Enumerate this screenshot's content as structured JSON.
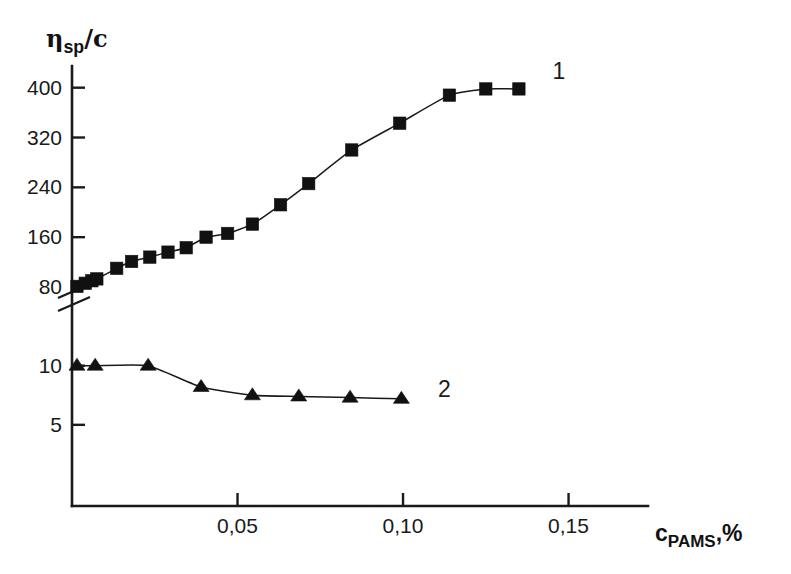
{
  "chart_data": {
    "type": "line",
    "title": "",
    "subtitle": "",
    "xlabel": "c_PAMS, %",
    "ylabel": "eta_sp/c",
    "xlim": [
      0,
      0.174
    ],
    "ylim_upper": [
      80,
      430
    ],
    "ylim_lower": [
      0,
      12
    ],
    "grid": false,
    "legend_position": "inline-right",
    "axis_break": true,
    "axis_break_note": "y-axis broken between 10 and 80",
    "xticks": [
      0.05,
      0.1,
      0.15
    ],
    "xtick_labels": [
      "0,05",
      "0,10",
      "0,15"
    ],
    "yticks_upper": [
      80,
      160,
      240,
      320,
      400
    ],
    "ytick_labels_upper": [
      "80",
      "160",
      "240",
      "320",
      "400"
    ],
    "yticks_lower": [
      5,
      10
    ],
    "ytick_labels_lower": [
      "5",
      "10"
    ],
    "series": [
      {
        "name": "1",
        "label": "1",
        "marker": "square",
        "axis": "upper",
        "x": [
          0.0015,
          0.004,
          0.006,
          0.0075,
          0.0135,
          0.018,
          0.0235,
          0.029,
          0.0345,
          0.0405,
          0.047,
          0.0545,
          0.063,
          0.0715,
          0.0845,
          0.099,
          0.114,
          0.125,
          0.135
        ],
        "values": [
          81,
          86,
          90,
          93,
          110,
          121,
          128,
          136,
          143,
          160,
          166,
          181,
          212,
          246,
          300,
          343,
          388,
          398,
          398
        ]
      },
      {
        "name": "2",
        "label": "2",
        "marker": "triangle",
        "axis": "lower",
        "x": [
          0.0015,
          0.007,
          0.023,
          0.039,
          0.0545,
          0.0685,
          0.084,
          0.0995
        ],
        "values": [
          10.0,
          10.0,
          10.0,
          8.2,
          7.5,
          7.4,
          7.3,
          7.2
        ]
      }
    ]
  },
  "axis_titles": {
    "y_symbol": "η",
    "y_sub": "sp",
    "y_suffix": "/c",
    "x_symbol": "c",
    "x_sub": "PAMS",
    "x_suffix": ",%"
  }
}
